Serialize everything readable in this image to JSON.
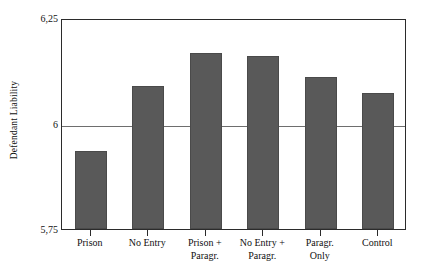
{
  "chart_data": {
    "type": "bar",
    "title": "",
    "xlabel": "",
    "ylabel": "Defendant Liability",
    "ylim": [
      5.75,
      6.25
    ],
    "yticks": [
      "5,75",
      "6",
      "6,25"
    ],
    "ytick_values": [
      5.75,
      6.0,
      6.25
    ],
    "gridlines": [
      "6"
    ],
    "legend": null,
    "categories": [
      "Prison",
      "No Entry",
      "Prison + Paragr.",
      "No Entry + Paragr.",
      "Paragr. Only",
      "Control"
    ],
    "category_lines": [
      [
        "Prison",
        ""
      ],
      [
        "No Entry",
        ""
      ],
      [
        "Prison +",
        "Paragr."
      ],
      [
        "No Entry +",
        "Paragr."
      ],
      [
        "Paragr.",
        "Only"
      ],
      [
        "Control",
        ""
      ]
    ],
    "values": [
      5.934,
      6.09,
      6.168,
      6.159,
      6.111,
      6.073
    ],
    "bar_color": "#595959",
    "frame_color": "#2b2b2b",
    "gridline_color": "#6e6e6e"
  },
  "axes": {
    "y_title": "Defendant Liability",
    "y_tick_top": "6,25",
    "y_tick_mid": "6",
    "y_tick_bottom": "5,75"
  }
}
